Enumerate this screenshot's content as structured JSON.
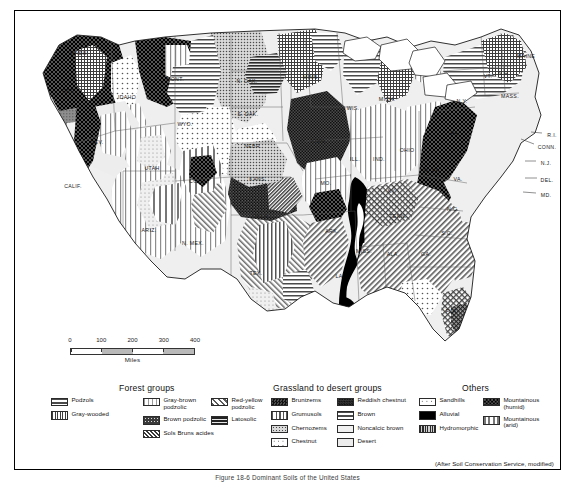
{
  "figure": {
    "caption": "Figure 18-6  Dominant Soils of the United States",
    "credit": "(After Soil Conservation Service, modified)"
  },
  "scalebar": {
    "ticks": [
      "0",
      "100",
      "200",
      "300",
      "400"
    ],
    "unit": "Miles"
  },
  "legend": {
    "sections": [
      {
        "title": "Forest groups",
        "columns": [
          {
            "items": [
              {
                "label": "Podzols",
                "pattern": "horizontal-lines"
              },
              {
                "label": "Gray-wooded",
                "pattern": "fine-grid"
              }
            ]
          },
          {
            "items": [
              {
                "label": "Gray-brown\npodzolic",
                "pattern": "vertical-lines-light"
              },
              {
                "label": "Brown podzolic",
                "pattern": "dark-speckle"
              },
              {
                "label": "Sols Bruns acides",
                "pattern": "dense-diagonal"
              }
            ]
          },
          {
            "items": [
              {
                "label": "Red-yellow\npodzolic",
                "pattern": "diagonal-hatch"
              },
              {
                "label": "Latosolic",
                "pattern": "horizontal-lines-dark"
              }
            ]
          }
        ]
      },
      {
        "title": "Grassland to desert groups",
        "columns": [
          {
            "items": [
              {
                "label": "Brunizems",
                "pattern": "dark-checker"
              },
              {
                "label": "Grumusols",
                "pattern": "vertical-lines"
              },
              {
                "label": "Chernozems",
                "pattern": "fine-dots"
              },
              {
                "label": "Chestnut",
                "pattern": "sparse-dots"
              }
            ]
          },
          {
            "items": [
              {
                "label": "Reddish chestnut",
                "pattern": "dark-texture"
              },
              {
                "label": "Brown",
                "pattern": "horizontal-lines"
              },
              {
                "label": "Noncalcic brown",
                "pattern": "light-dots"
              },
              {
                "label": "Desert",
                "pattern": "plain-light"
              }
            ]
          }
        ]
      },
      {
        "title": "Others",
        "columns": [
          {
            "items": [
              {
                "label": "Sandhills",
                "pattern": "sparse-dots-white"
              },
              {
                "label": "Alluvial",
                "pattern": "solid-black"
              },
              {
                "label": "Hydromorphic",
                "pattern": "dense-grid"
              }
            ]
          },
          {
            "items": [
              {
                "label": "Mountainous\n(humid)",
                "pattern": "dark-checker-coarse"
              },
              {
                "label": "Mountainous\n(arid)",
                "pattern": "vertical-lines-wide"
              }
            ]
          }
        ]
      }
    ]
  },
  "map": {
    "state_labels": [
      {
        "text": "NEV.",
        "x": 82,
        "y": 131
      },
      {
        "text": "UTAH",
        "x": 137,
        "y": 157
      },
      {
        "text": "ARIZ.",
        "x": 134,
        "y": 219
      },
      {
        "text": "COLO.",
        "x": 183,
        "y": 170
      },
      {
        "text": "N. MEX.",
        "x": 178,
        "y": 232
      },
      {
        "text": "WYO.",
        "x": 170,
        "y": 113
      },
      {
        "text": "MONT.",
        "x": 160,
        "y": 68
      },
      {
        "text": "IDAHO",
        "x": 112,
        "y": 86
      },
      {
        "text": "ORE.",
        "x": 54,
        "y": 80
      },
      {
        "text": "WASH.",
        "x": 64,
        "y": 42
      },
      {
        "text": "CALIF.",
        "x": 58,
        "y": 175
      },
      {
        "text": "N. DAK.",
        "x": 232,
        "y": 70
      },
      {
        "text": "S. DAK.",
        "x": 233,
        "y": 103
      },
      {
        "text": "NEBR.",
        "x": 238,
        "y": 135
      },
      {
        "text": "KANS.",
        "x": 243,
        "y": 168
      },
      {
        "text": "OKLA.",
        "x": 246,
        "y": 205
      },
      {
        "text": "TEX.",
        "x": 241,
        "y": 262
      },
      {
        "text": "MINN.",
        "x": 296,
        "y": 66
      },
      {
        "text": "IOWA",
        "x": 303,
        "y": 130
      },
      {
        "text": "MO.",
        "x": 311,
        "y": 172
      },
      {
        "text": "ARK.",
        "x": 317,
        "y": 220
      },
      {
        "text": "LA.",
        "x": 325,
        "y": 265
      },
      {
        "text": "WIS.",
        "x": 338,
        "y": 97
      },
      {
        "text": "ILL.",
        "x": 340,
        "y": 148
      },
      {
        "text": "MISS.",
        "x": 349,
        "y": 240
      },
      {
        "text": "MICH.",
        "x": 372,
        "y": 88
      },
      {
        "text": "IND.",
        "x": 364,
        "y": 148
      },
      {
        "text": "KY.",
        "x": 377,
        "y": 180
      },
      {
        "text": "TENN.",
        "x": 383,
        "y": 205
      },
      {
        "text": "ALA.",
        "x": 378,
        "y": 243
      },
      {
        "text": "OHIO",
        "x": 392,
        "y": 139
      },
      {
        "text": "GA.",
        "x": 411,
        "y": 243
      },
      {
        "text": "FLA.",
        "x": 437,
        "y": 300
      },
      {
        "text": "W. VA.",
        "x": 417,
        "y": 159
      },
      {
        "text": "VA.",
        "x": 443,
        "y": 168
      },
      {
        "text": "N.C.",
        "x": 438,
        "y": 198
      },
      {
        "text": "S.C.",
        "x": 432,
        "y": 222
      },
      {
        "text": "PA.",
        "x": 440,
        "y": 122
      },
      {
        "text": "N.Y.",
        "x": 447,
        "y": 90
      },
      {
        "text": "MASS.",
        "x": 495,
        "y": 85
      },
      {
        "text": "VT.",
        "x": 473,
        "y": 65
      },
      {
        "text": "N.H.",
        "x": 489,
        "y": 62
      },
      {
        "text": "MAINE",
        "x": 511,
        "y": 45
      }
    ],
    "leader_labels": [
      {
        "text": "R.I.",
        "x": 537,
        "y": 124,
        "lx": 516,
        "ly": 121
      },
      {
        "text": "CONN.",
        "x": 532,
        "y": 136,
        "lx": 506,
        "ly": 128
      },
      {
        "text": "N.J.",
        "x": 531,
        "y": 152,
        "lx": 510,
        "ly": 150
      },
      {
        "text": "DEL.",
        "x": 532,
        "y": 169,
        "lx": 510,
        "ly": 167
      },
      {
        "text": "MD.",
        "x": 531,
        "y": 184,
        "lx": 508,
        "ly": 181
      }
    ]
  }
}
